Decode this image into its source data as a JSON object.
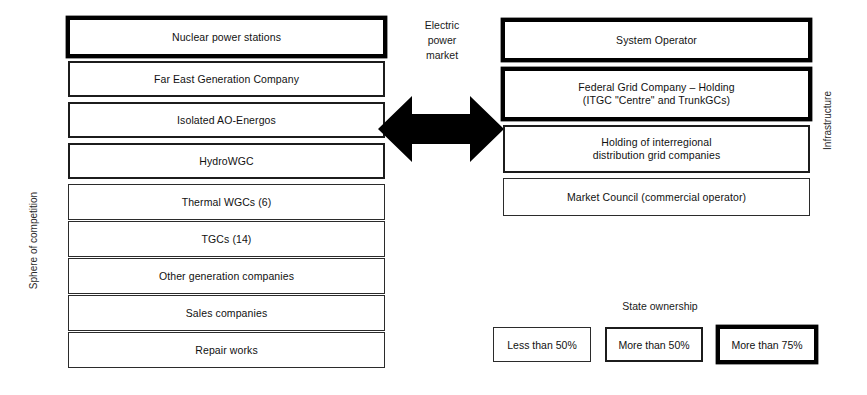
{
  "diagram": {
    "title_center": "Electric\npower\nmarket",
    "center_label_lines": [
      "Electric",
      "power",
      "market"
    ],
    "arrow": {
      "name": "double-headed-arrow",
      "direction": "bidirectional-horizontal",
      "color": "#000000"
    },
    "left_axis_label": "Sphere of competition",
    "right_axis_label": "Infrastructure",
    "competition_column": [
      {
        "label": "Nuclear power stations",
        "ownership": "more-than-75",
        "style": "own-high",
        "top": 18,
        "height": 38
      },
      {
        "label": "Far East Generation Company",
        "ownership": "more-than-50",
        "style": "own-mid",
        "top": 61,
        "height": 36
      },
      {
        "label": "Isolated AO-Energos",
        "ownership": "more-than-50",
        "style": "own-mid",
        "top": 102,
        "height": 36
      },
      {
        "label": "HydroWGC",
        "ownership": "more-than-50",
        "style": "own-mid",
        "top": 143,
        "height": 36
      },
      {
        "label": "Thermal WGCs (6)",
        "ownership": "less-than-50",
        "style": "own-low",
        "top": 184,
        "height": 36
      },
      {
        "label": "TGCs (14)",
        "ownership": "less-than-50",
        "style": "own-low",
        "top": 221,
        "height": 36
      },
      {
        "label": "Other generation companies",
        "ownership": "less-than-50",
        "style": "own-low",
        "top": 258,
        "height": 36
      },
      {
        "label": "Sales companies",
        "ownership": "less-than-50",
        "style": "own-low",
        "top": 295,
        "height": 36
      },
      {
        "label": "Repair works",
        "ownership": "less-than-50",
        "style": "own-low",
        "top": 332,
        "height": 36
      }
    ],
    "infrastructure_column": [
      {
        "label": "System Operator",
        "ownership": "more-than-75",
        "style": "own-high",
        "top": 20,
        "height": 40
      },
      {
        "label": "Federal Grid Company – Holding\n(ITGC \"Centre\" and TrunkGCs)",
        "ownership": "more-than-75",
        "style": "own-high",
        "top": 69,
        "height": 50
      },
      {
        "label": "Holding of interregional\ndistribution grid companies",
        "ownership": "more-than-50",
        "style": "own-mid",
        "top": 125,
        "height": 48
      },
      {
        "label": "Market Council (commercial operator)",
        "ownership": "less-than-50",
        "style": "own-low",
        "top": 178,
        "height": 38
      }
    ],
    "legend": {
      "title": "State ownership",
      "items": [
        {
          "label": "Less than 50%",
          "style": "own-low",
          "left": 493,
          "width": 98
        },
        {
          "label": "More than 50%",
          "style": "own-mid",
          "left": 605,
          "width": 98
        },
        {
          "label": "More than 75%",
          "style": "own-high",
          "left": 718,
          "width": 98
        }
      ]
    },
    "colors": {
      "stroke": "#000000",
      "background": "#ffffff",
      "text": "#111111"
    }
  }
}
